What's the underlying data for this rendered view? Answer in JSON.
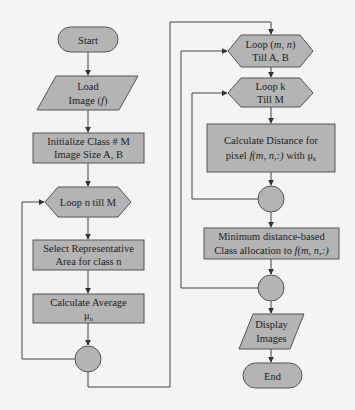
{
  "colors": {
    "background": "#f4f4f4",
    "shape_fill": "#b4b4b4",
    "stroke": "#555555"
  },
  "left_column": {
    "start": "Start",
    "load": {
      "line1": "Load",
      "line2_prefix": "Image (",
      "line2_var": "f",
      "line2_suffix": ")"
    },
    "initialize": {
      "line1": "Initialize Class # M",
      "line2": "Image Size A, B"
    },
    "loop_n": "Loop n till M",
    "select": {
      "line1": "Select Representative",
      "line2": "Area for class n"
    },
    "average": {
      "line1": "Calculate Average",
      "line2_symbol": "μ",
      "line2_sub": "n"
    }
  },
  "right_column": {
    "loop_mn": {
      "line1_prefix": "Loop (",
      "line1_var": "m, n",
      "line1_suffix": ")",
      "line2": "Till A, B"
    },
    "loop_k": {
      "line1": "Loop k",
      "line2": "Till M"
    },
    "distance": {
      "line1": "Calculate Distance for",
      "line2_prefix": "pixel ",
      "line2_var": "f",
      "line2_args": "(m, n,:)",
      "line2_mid": " with ",
      "line2_symbol": "μ",
      "line2_sub": "k"
    },
    "min_distance": {
      "line1": "Minimum distance-based",
      "line2_prefix": "Class allocation to ",
      "line2_var": "f",
      "line2_args": "(m, n,:)"
    },
    "display": {
      "line1": "Display",
      "line2": "Images"
    },
    "end": "End"
  }
}
